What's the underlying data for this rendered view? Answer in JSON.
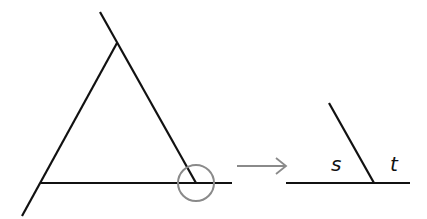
{
  "diagram": {
    "colors": {
      "line": "#111111",
      "highlight": "#8a8a8a",
      "arrow": "#8a8a8a"
    },
    "labels": {
      "s": "s",
      "t": "t"
    },
    "arrow_icon": "right-arrow-icon"
  }
}
